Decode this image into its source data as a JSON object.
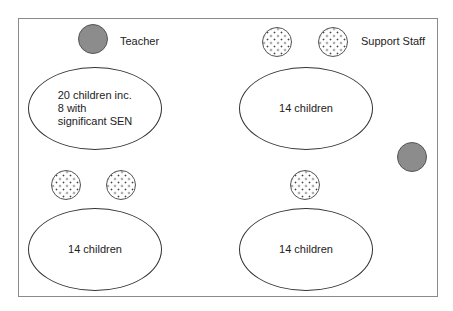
{
  "legend": {
    "teacher_label": "Teacher",
    "support_staff_label": "Support Staff"
  },
  "tables": [
    {
      "label": "20 children inc.\n8 with\nsignificant SEN"
    },
    {
      "label": "14 children"
    },
    {
      "label": "14 children"
    },
    {
      "label": "14 children"
    }
  ],
  "colors": {
    "teacher_fill": "#8c8c8c",
    "staff_fill": "#ffffff",
    "border": "#8a8a8a"
  }
}
